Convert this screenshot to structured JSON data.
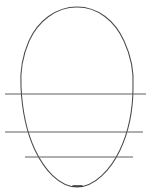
{
  "figure": {
    "background_color": "#ffffff",
    "width": 152,
    "height": 195,
    "stroke_color_outline": "#4b4b4b",
    "stroke_color_lines": "#5f5f5f",
    "stroke_color_vertex": "#2e2e2e"
  },
  "shapes": {
    "oval": {
      "name": "egg-outline",
      "description": "hand-drawn closed oval, wider and rounder at the top, tapering narrower toward the bottom",
      "top_y": 7,
      "bottom_y": 187,
      "left_x": 21,
      "right_x": 133,
      "center_x": 77,
      "widest_y": 84,
      "path": "M 77 7 C 56 7 38 21 29 41 C 22 57 20 72 21 87 C 22 108 26 131 35 150 C 44 169 59 187 77 187 C 95 187 111 169 120 150 C 129 131 133 108 133 87 C 134 71 131 56 124 41 C 115 21 98 7 77 7 Z"
    },
    "chord_lines": [
      {
        "name": "chord-line-upper",
        "y": 94,
        "x_start": 5,
        "x_end": 146,
        "length": 141,
        "note": "longest line, extends past the oval on both sides"
      },
      {
        "name": "chord-line-middle",
        "y": 132,
        "x_start": 5,
        "x_end": 143,
        "length": 138,
        "note": "extends past the oval on both sides"
      },
      {
        "name": "chord-line-lower",
        "y": 157,
        "x_start": 25,
        "x_end": 133,
        "length": 108,
        "note": "shortest line, sits lowest and is inset from the left edge"
      }
    ],
    "vertex_mark": {
      "name": "bottom-vertex-tick",
      "x_start": 73,
      "x_end": 82,
      "y": 186,
      "note": "short dark tick at the bottom apex of the oval"
    }
  }
}
